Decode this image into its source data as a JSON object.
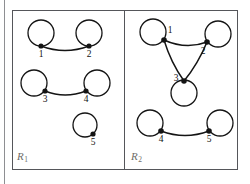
{
  "figure": {
    "background_color": "#ffffff",
    "stroke_color": "#141414",
    "border_color": "#55565a",
    "label_color": "#6e6c68",
    "node_label_color": "#111111",
    "width": 250,
    "height": 184
  },
  "panels": [
    {
      "id": "R1",
      "label_letter": "R",
      "label_subscript": "1",
      "nodes": [
        {
          "id": "1",
          "label": "1",
          "dot_x": 41,
          "dot_y": 46,
          "loop_cx": 41,
          "loop_cy": 33,
          "loop_r": 13,
          "label_x": 41,
          "label_y": 57
        },
        {
          "id": "2",
          "label": "2",
          "dot_x": 89,
          "dot_y": 46,
          "loop_cx": 89,
          "loop_cy": 33,
          "loop_r": 13,
          "label_x": 89,
          "label_y": 57
        },
        {
          "id": "3",
          "label": "3",
          "dot_x": 45,
          "dot_y": 91,
          "loop_cx": 34,
          "loop_cy": 83,
          "loop_r": 13,
          "label_x": 45,
          "label_y": 102
        },
        {
          "id": "4",
          "label": "4",
          "dot_x": 86,
          "dot_y": 91,
          "loop_cx": 97,
          "loop_cy": 83,
          "loop_r": 13,
          "label_x": 86,
          "label_y": 102
        },
        {
          "id": "5",
          "label": "5",
          "dot_x": 93,
          "dot_y": 134,
          "loop_cx": 85,
          "loop_cy": 125,
          "loop_r": 12,
          "label_x": 93,
          "label_y": 145
        }
      ],
      "edges": [
        {
          "from": "1",
          "to": "2",
          "curve": "down"
        },
        {
          "from": "3",
          "to": "4",
          "curve": "down"
        }
      ]
    },
    {
      "id": "R2",
      "label_letter": "R",
      "label_subscript": "2",
      "nodes": [
        {
          "id": "1",
          "label": "1",
          "dot_x": 164,
          "dot_y": 40,
          "loop_cx": 153,
          "loop_cy": 32,
          "loop_r": 13,
          "label_x": 170,
          "label_y": 33
        },
        {
          "id": "2",
          "label": "2",
          "dot_x": 207,
          "dot_y": 42,
          "loop_cx": 218,
          "loop_cy": 34,
          "loop_r": 13,
          "label_x": 203,
          "label_y": 54
        },
        {
          "id": "3",
          "label": "3",
          "dot_x": 184,
          "dot_y": 81,
          "loop_cx": 184,
          "loop_cy": 93,
          "loop_r": 13,
          "label_x": 176,
          "label_y": 81
        },
        {
          "id": "4",
          "label": "4",
          "dot_x": 161,
          "dot_y": 131,
          "loop_cx": 150,
          "loop_cy": 123,
          "loop_r": 13,
          "label_x": 161,
          "label_y": 142
        },
        {
          "id": "5",
          "label": "5",
          "dot_x": 209,
          "dot_y": 131,
          "loop_cx": 220,
          "loop_cy": 123,
          "loop_r": 13,
          "label_x": 209,
          "label_y": 142
        }
      ],
      "edges": [
        {
          "from": "1",
          "to": "2",
          "curve": "down"
        },
        {
          "from": "1",
          "to": "3",
          "curve": "straight"
        },
        {
          "from": "2",
          "to": "3",
          "curve": "straight"
        },
        {
          "from": "4",
          "to": "5",
          "curve": "down"
        }
      ]
    }
  ],
  "frame": {
    "outer_left": 12,
    "outer_top": 10,
    "outer_right": 238,
    "outer_bottom": 170,
    "divider_x": 124,
    "margin_rule_x": 4,
    "margin_rule_top": 0,
    "margin_rule_bottom": 184
  }
}
